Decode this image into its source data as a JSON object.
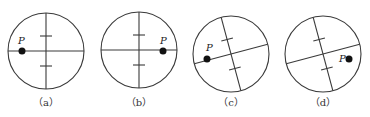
{
  "figure": {
    "panels": [
      {
        "id": "a",
        "caption": "（a）",
        "point_label": "P",
        "cx": 46,
        "cy": 51,
        "r": 38,
        "angle": 0,
        "px": 22,
        "py": 51,
        "lx": 18,
        "ly": 44
      },
      {
        "id": "b",
        "caption": "（b）",
        "point_label": "P",
        "cx": 139,
        "cy": 50,
        "r": 38,
        "angle": 0,
        "px": 163,
        "py": 51,
        "lx": 160,
        "ly": 44
      },
      {
        "id": "c",
        "caption": "（c）",
        "point_label": "P",
        "cx": 231,
        "cy": 54,
        "r": 38,
        "angle": -15,
        "px": 207,
        "py": 59,
        "lx": 206,
        "ly": 51
      },
      {
        "id": "d",
        "caption": "（d）",
        "point_label": "P",
        "cx": 323,
        "cy": 54,
        "r": 38,
        "angle": -15,
        "px": 349,
        "py": 59,
        "lx": 339,
        "ly": 62
      }
    ],
    "colors": {
      "stroke": "#3a3a3a",
      "dot": "#111111"
    }
  }
}
